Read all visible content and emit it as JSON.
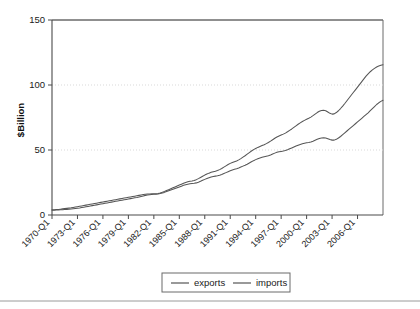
{
  "chart_data": {
    "type": "line",
    "title": "",
    "xlabel": "",
    "ylabel": "$Billion",
    "ylim": [
      0,
      150
    ],
    "yticks": [
      0,
      50,
      100,
      150
    ],
    "grid": "horizontal-dotted",
    "legend_position": "bottom-center",
    "x_tick_labels": [
      "1970-Q1",
      "1973-Q1",
      "1976-Q1",
      "1979-Q1",
      "1982-Q1",
      "1985-Q1",
      "1988-Q1",
      "1991-Q1",
      "1994-Q1",
      "1997-Q1",
      "2000-Q1",
      "2003-Q1",
      "2006-Q1"
    ],
    "x_tick_step_quarters": 12,
    "x_start": "1970-Q1",
    "x_end": "2006-Q4",
    "series": [
      {
        "name": "exports",
        "color": "#555555",
        "values": [
          3.6,
          3.7,
          3.8,
          3.9,
          4.0,
          4.1,
          4.2,
          4.3,
          4.4,
          4.6,
          4.8,
          5.0,
          5.2,
          5.4,
          5.7,
          6.0,
          6.3,
          6.6,
          6.9,
          7.2,
          7.5,
          7.8,
          8.1,
          8.4,
          8.7,
          9.0,
          9.3,
          9.6,
          9.9,
          10.2,
          10.5,
          10.8,
          11.1,
          11.4,
          11.7,
          12.0,
          12.3,
          12.6,
          12.9,
          13.2,
          13.5,
          13.9,
          14.3,
          14.7,
          15.1,
          15.4,
          15.6,
          15.8,
          15.9,
          16.0,
          16.2,
          16.5,
          16.9,
          17.4,
          18.0,
          18.6,
          19.2,
          19.8,
          20.4,
          21.0,
          21.6,
          22.2,
          22.8,
          23.3,
          23.7,
          24.0,
          24.2,
          24.4,
          24.7,
          25.2,
          25.9,
          26.7,
          27.4,
          28.0,
          28.6,
          29.2,
          29.6,
          29.9,
          30.2,
          30.6,
          31.2,
          31.9,
          32.6,
          33.3,
          34.0,
          34.6,
          35.1,
          35.6,
          36.2,
          36.9,
          37.6,
          38.3,
          39.1,
          40.0,
          40.9,
          41.8,
          42.6,
          43.3,
          43.9,
          44.4,
          44.8,
          45.2,
          45.6,
          46.2,
          46.9,
          47.6,
          48.2,
          48.6,
          48.9,
          49.2,
          49.6,
          50.2,
          50.9,
          51.6,
          52.3,
          53.0,
          53.7,
          54.3,
          54.8,
          55.2,
          55.5,
          55.8,
          56.2,
          56.8,
          57.5,
          58.2,
          58.8,
          59.2,
          59.4,
          59.2,
          58.6,
          58.0,
          57.6,
          57.6,
          58.2,
          59.2,
          60.4,
          61.8,
          63.2,
          64.6,
          66.0,
          67.4,
          68.8,
          70.2,
          71.6,
          73.0,
          74.4,
          75.8,
          77.2,
          78.6,
          80.2,
          81.8,
          83.4,
          85.0,
          86.3,
          87.4,
          88.2
        ]
      },
      {
        "name": "imports",
        "color": "#555555",
        "values": [
          4.0,
          4.1,
          4.2,
          4.3,
          4.5,
          4.7,
          4.9,
          5.1,
          5.3,
          5.5,
          5.8,
          6.1,
          6.4,
          6.7,
          7.0,
          7.3,
          7.6,
          7.9,
          8.2,
          8.5,
          8.8,
          9.1,
          9.4,
          9.7,
          10.0,
          10.3,
          10.6,
          10.9,
          11.2,
          11.5,
          11.8,
          12.1,
          12.4,
          12.7,
          13.0,
          13.3,
          13.6,
          13.9,
          14.2,
          14.5,
          14.8,
          15.1,
          15.4,
          15.7,
          15.9,
          16.1,
          16.2,
          16.3,
          16.3,
          16.4,
          16.6,
          17.0,
          17.5,
          18.1,
          18.8,
          19.5,
          20.2,
          20.9,
          21.6,
          22.3,
          23.0,
          23.7,
          24.4,
          25.0,
          25.5,
          25.9,
          26.2,
          26.6,
          27.2,
          28.0,
          28.9,
          29.8,
          30.7,
          31.5,
          32.2,
          32.8,
          33.3,
          33.7,
          34.2,
          34.9,
          35.8,
          36.8,
          37.8,
          38.8,
          39.7,
          40.4,
          41.0,
          41.6,
          42.4,
          43.4,
          44.5,
          45.6,
          46.8,
          48.0,
          49.2,
          50.3,
          51.2,
          52.0,
          52.7,
          53.4,
          54.1,
          54.9,
          55.8,
          56.8,
          57.9,
          59.0,
          60.0,
          60.8,
          61.5,
          62.2,
          63.0,
          64.0,
          65.1,
          66.2,
          67.4,
          68.6,
          69.8,
          70.9,
          71.9,
          72.8,
          73.6,
          74.4,
          75.3,
          76.4,
          77.6,
          78.8,
          79.8,
          80.4,
          80.6,
          80.2,
          79.2,
          78.2,
          77.6,
          77.8,
          78.8,
          80.2,
          81.9,
          83.8,
          85.8,
          87.9,
          90.0,
          92.1,
          94.2,
          96.3,
          98.4,
          100.5,
          102.6,
          104.7,
          106.8,
          108.6,
          110.2,
          111.6,
          112.8,
          113.8,
          114.6,
          115.2,
          115.6
        ]
      }
    ]
  },
  "legend": {
    "items": [
      {
        "label": "exports"
      },
      {
        "label": "imports"
      }
    ]
  },
  "axes": {
    "y_label": "$Billion",
    "y_tick_labels": [
      "0",
      "50",
      "100",
      "150"
    ]
  }
}
